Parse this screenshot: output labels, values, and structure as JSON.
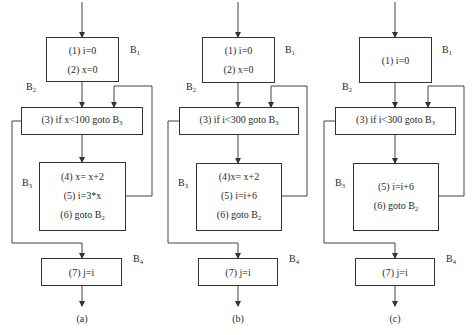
{
  "diagrams": [
    {
      "caption": "(a)",
      "blocks": {
        "B1": {
          "label": "B",
          "sub": "1",
          "statements": [
            "(1) i=0",
            "(2) x=0"
          ]
        },
        "B2": {
          "label": "B",
          "sub": "2",
          "statement_prefix": "(3) if x<100 goto B",
          "statement_sub": "3"
        },
        "B3": {
          "label": "B",
          "sub": "3",
          "statements": [
            "(4) x= x+2",
            "(5) i=3*x"
          ],
          "goto_prefix": "(6) goto B",
          "goto_sub": "2"
        },
        "B4": {
          "label": "B",
          "sub": "4",
          "statements": [
            "(7) j=i"
          ]
        }
      }
    },
    {
      "caption": "(b)",
      "blocks": {
        "B1": {
          "label": "B",
          "sub": "1",
          "statements": [
            "(1) i=0",
            "(2) x=0"
          ]
        },
        "B2": {
          "label": "B",
          "sub": "2",
          "statement_prefix": "(3) if i<300 goto B",
          "statement_sub": "3"
        },
        "B3": {
          "label": "B",
          "sub": "3",
          "statements": [
            "(4)x= x+2",
            "(5) i=i+6"
          ],
          "goto_prefix": "(6) goto B",
          "goto_sub": "2"
        },
        "B4": {
          "label": "B",
          "sub": "4",
          "statements": [
            "(7) j=i"
          ]
        }
      }
    },
    {
      "caption": "(c)",
      "blocks": {
        "B1": {
          "label": "B",
          "sub": "1",
          "statements": [
            "(1) i=0"
          ]
        },
        "B2": {
          "label": "B",
          "sub": "2",
          "statement_prefix": "(3) if i<300 goto B",
          "statement_sub": "3"
        },
        "B3": {
          "label": "B",
          "sub": "3",
          "statements": [
            "(5) i=i+6"
          ],
          "goto_prefix": "(6) goto B",
          "goto_sub": "2"
        },
        "B4": {
          "label": "B",
          "sub": "4",
          "statements": [
            "(7) j=i"
          ]
        }
      }
    }
  ],
  "colors": {
    "line": "#333333",
    "text": "#2a2a2a",
    "background": "#ffffff"
  }
}
